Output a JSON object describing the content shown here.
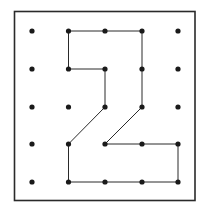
{
  "diagram": {
    "type": "geoboard",
    "grid": {
      "columns": 5,
      "rows": 5,
      "x_positions": [
        32,
        68.5,
        105,
        142,
        178
      ],
      "y_positions": [
        31,
        69,
        107,
        144,
        182
      ]
    },
    "frame": {
      "x": 14.5,
      "y": 11.5,
      "width": 180.5,
      "height": 189,
      "stroke": "#2a2a2a",
      "stroke_width": 1.6
    },
    "dot": {
      "radius": 2.6,
      "color": "#1a1a1a"
    },
    "polygon": {
      "shape_description": "numeral 2",
      "stroke": "#2a2a2a",
      "stroke_width": 1,
      "vertices": [
        [
          1,
          0
        ],
        [
          2,
          0
        ],
        [
          3,
          0
        ],
        [
          3,
          1
        ],
        [
          3,
          2
        ],
        [
          2,
          3
        ],
        [
          3,
          3
        ],
        [
          4,
          3
        ],
        [
          4,
          4
        ],
        [
          3,
          4
        ],
        [
          2,
          4
        ],
        [
          1,
          4
        ],
        [
          1,
          3
        ],
        [
          2,
          2
        ],
        [
          2,
          1
        ],
        [
          1,
          1
        ]
      ]
    }
  }
}
